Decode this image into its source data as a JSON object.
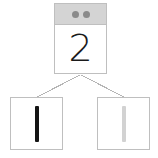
{
  "diagram": {
    "type": "number-decomposition-tree",
    "background_color": "#ffffff",
    "border_color": "#bfbfbf",
    "connector_color": "#b5b5b5",
    "parent": {
      "card_name": "parent-card",
      "header": {
        "background_color": "#d4d4d4",
        "dot_color": "#8a8a8a",
        "dot_count": 2,
        "dots": [
          {
            "label": ""
          },
          {
            "label": ""
          }
        ]
      },
      "value": "2",
      "value_color": "#1a1a1a"
    },
    "children": [
      {
        "card_name": "child-card-left",
        "mark": "tally-mark",
        "mark_value": "1",
        "mark_color": "#151515",
        "mark_state": "filled"
      },
      {
        "card_name": "child-card-right",
        "mark": "tally-mark",
        "mark_value": "1",
        "mark_color": "#d2d2d2",
        "mark_state": "faded"
      }
    ],
    "connectors": [
      {
        "from": "parent-card-bottom-center",
        "to": "child-card-left-top"
      },
      {
        "from": "parent-card-bottom-center",
        "to": "child-card-right-top"
      }
    ]
  }
}
